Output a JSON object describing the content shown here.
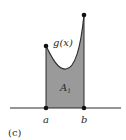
{
  "figure": {
    "caption": "(c)",
    "function_label": "g(x)",
    "area_label_main": "A",
    "area_label_sub": "1",
    "point_a_label": "a",
    "point_b_label": "b"
  },
  "colors": {
    "fill": "#9a9a9a",
    "stroke": "#2b2b2b",
    "background": "#ffffff"
  }
}
